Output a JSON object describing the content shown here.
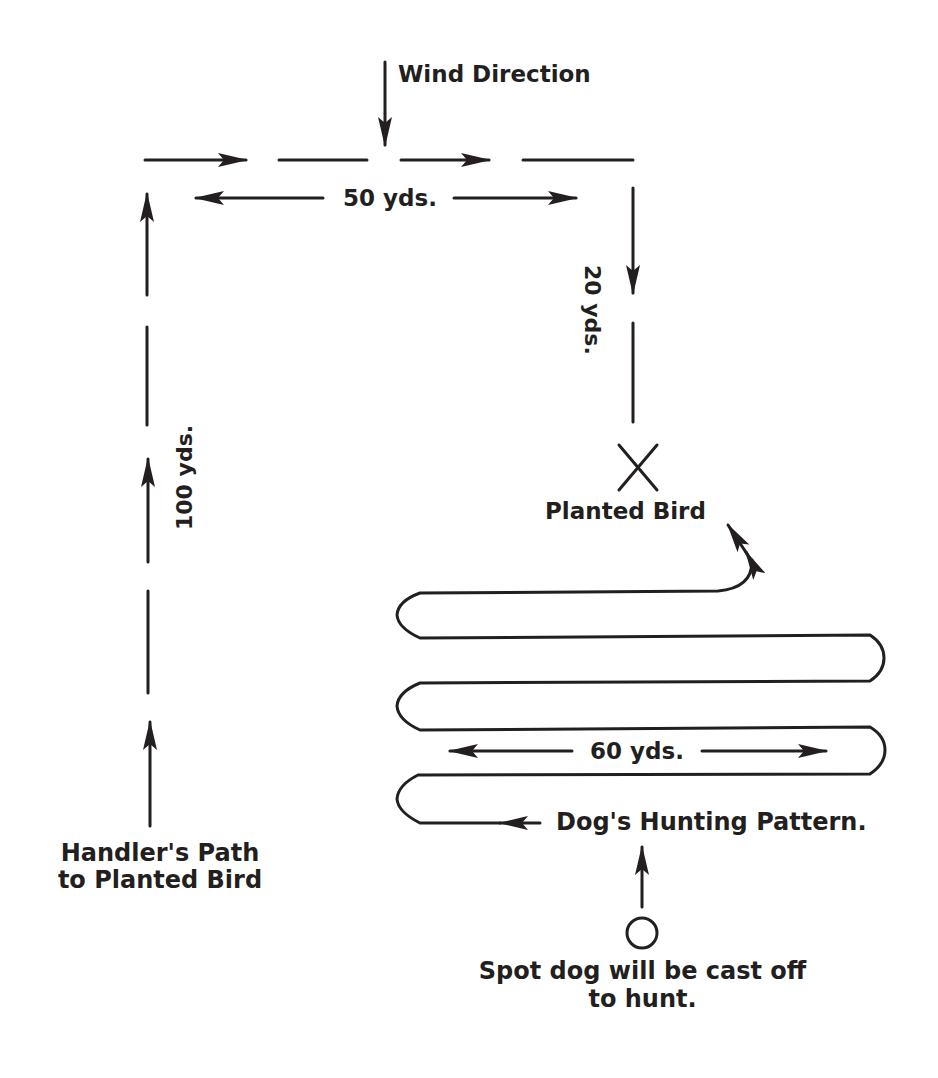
{
  "diagram": {
    "type": "field-training-layout",
    "colors": {
      "ink": "#231f20",
      "background": "#ffffff"
    },
    "labels": {
      "wind_direction": "Wind Direction",
      "width_top": "50 yds.",
      "right_leg": "20 yds.",
      "left_leg": "100 yds.",
      "planted_bird": "Planted Bird",
      "pattern_width": "60 yds.",
      "dog_pattern": "Dog's Hunting Pattern.",
      "handler_path_line1": "Handler's Path",
      "handler_path_line2": "to Planted Bird",
      "cast_off_line1": "Spot dog will be cast off",
      "cast_off_line2": "to hunt."
    },
    "markers": {
      "planted_bird_icon": "x-mark",
      "cast_off_icon": "circle",
      "wind_icon": "arrow-down"
    },
    "distances_yds": {
      "handler_up": 100,
      "handler_across": 50,
      "handler_down": 20,
      "dog_sweep": 60
    }
  }
}
